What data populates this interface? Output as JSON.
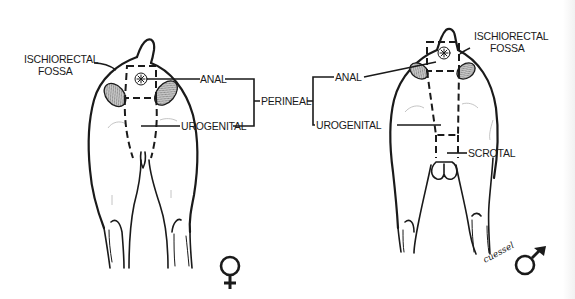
{
  "figure": {
    "colors": {
      "ink": "#1a1a1a",
      "background": "#ffffff",
      "hatch": "#8a8a8a"
    }
  },
  "labels": {
    "center": "PERINEAL",
    "female": {
      "ischiorectal_line1": "ISCHIORECTAL",
      "ischiorectal_line2": "FOSSA",
      "anal": "ANAL",
      "urogenital": "UROGENITAL",
      "sex_symbol": "♀"
    },
    "male": {
      "ischiorectal_line1": "ISCHIORECTAL",
      "ischiorectal_line2": "FOSSA",
      "anal": "ANAL",
      "urogenital": "UROGENITAL",
      "scrotal": "SCROTAL",
      "sex_symbol": "♂"
    }
  },
  "signature": "cuessel"
}
